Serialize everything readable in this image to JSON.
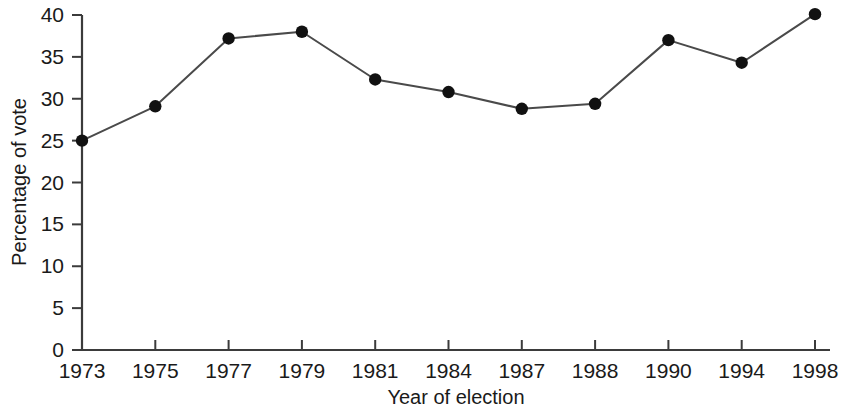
{
  "chart_data": {
    "type": "line",
    "title": "",
    "xlabel": "Year of election",
    "ylabel": "Percentage of vote",
    "categories": [
      "1973",
      "1975",
      "1977",
      "1979",
      "1981",
      "1984",
      "1987",
      "1988",
      "1990",
      "1994",
      "1998"
    ],
    "values": [
      25.0,
      29.1,
      37.2,
      38.0,
      32.3,
      30.8,
      28.8,
      29.4,
      37.0,
      34.3,
      40.1
    ],
    "series": [
      {
        "name": "Percentage of vote",
        "values": [
          25.0,
          29.1,
          37.2,
          38.0,
          32.3,
          30.8,
          28.8,
          29.4,
          37.0,
          34.3,
          40.1
        ]
      }
    ],
    "ylim": [
      0,
      40
    ],
    "yticks": [
      0,
      5,
      10,
      15,
      20,
      25,
      30,
      35,
      40
    ],
    "ytick_labels": [
      "0",
      "5",
      "10",
      "15",
      "20",
      "25",
      "30",
      "35",
      "40"
    ],
    "xtick_labels": [
      "1973",
      "1975",
      "1977",
      "1979",
      "1981",
      "1984",
      "1987",
      "1988",
      "1990",
      "1994",
      "1998"
    ],
    "grid": false,
    "legend": null,
    "legend_position": "none",
    "marker": "filled-circle",
    "line_color": "#4a4a4a",
    "marker_color": "#111111",
    "axis_color": "#3b3b3b",
    "background_color": "#ffffff"
  }
}
